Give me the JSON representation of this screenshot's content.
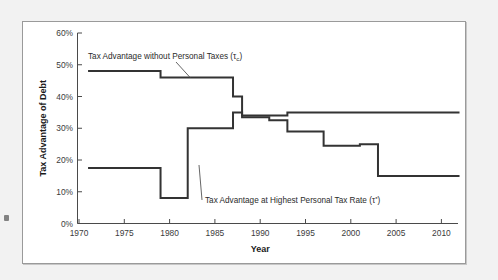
{
  "figure": {
    "panel_background": "#ffffff",
    "page_background": "#f2f2f2",
    "border_color": "#9a9a9a",
    "line_color": "#333333"
  },
  "chart_data": {
    "type": "line",
    "title": "",
    "subtitle": "",
    "xlabel": "Year",
    "ylabel": "Tax Advantage of Debt",
    "xlim": [
      1970,
      2012
    ],
    "ylim": [
      0,
      60
    ],
    "grid": false,
    "legend_position": "inline-annotations",
    "x_ticks": [
      1970,
      1975,
      1980,
      1985,
      1990,
      1995,
      2000,
      2005,
      2010
    ],
    "x_tick_labels": [
      "1970",
      "1975",
      "1980",
      "1985",
      "1990",
      "1995",
      "2000",
      "2005",
      "2010"
    ],
    "y_ticks": [
      0,
      10,
      20,
      30,
      40,
      50,
      60
    ],
    "y_tick_labels": [
      "0%",
      "10%",
      "20%",
      "30%",
      "40%",
      "50%",
      "60%"
    ],
    "step_style": "post",
    "series": [
      {
        "name": "Tax Advantage without Personal Taxes (τc)",
        "label_text": "Tax Advantage without Personal Taxes (",
        "label_symbol": "τ",
        "label_subscript": "c",
        "label_close": ")",
        "x": [
          1971,
          1979,
          1987,
          1988,
          1993,
          2012
        ],
        "values": [
          48,
          46,
          40,
          34,
          35,
          35
        ],
        "points": [
          {
            "year": 1971,
            "value": 48
          },
          {
            "year": 1979,
            "value": 46
          },
          {
            "year": 1987,
            "value": 40
          },
          {
            "year": 1988,
            "value": 34
          },
          {
            "year": 1993,
            "value": 35
          },
          {
            "year": 2012,
            "value": 35
          }
        ]
      },
      {
        "name": "Tax Advantage at Highest Personal Tax Rate (τ*)",
        "label_text": "Tax Advantage at Highest Personal Tax Rate (",
        "label_symbol": "τ",
        "label_subscript": "*",
        "label_close": ")",
        "x": [
          1971,
          1979,
          1982,
          1987,
          1988,
          1991,
          1993,
          1997,
          2001,
          2003,
          2012
        ],
        "values": [
          17.5,
          8,
          30,
          35,
          33.5,
          32.5,
          29,
          24.5,
          25,
          15,
          15
        ],
        "points": [
          {
            "year": 1971,
            "value": 17.5
          },
          {
            "year": 1979,
            "value": 8
          },
          {
            "year": 1982,
            "value": 30
          },
          {
            "year": 1987,
            "value": 35
          },
          {
            "year": 1988,
            "value": 33.5
          },
          {
            "year": 1991,
            "value": 32.5
          },
          {
            "year": 1993,
            "value": 29
          },
          {
            "year": 1997,
            "value": 24.5
          },
          {
            "year": 2001,
            "value": 25
          },
          {
            "year": 2003,
            "value": 15
          },
          {
            "year": 2012,
            "value": 15
          }
        ]
      }
    ],
    "annotations": [
      {
        "id": "annot-upper",
        "text": "Tax Advantage without Personal Taxes (τc)",
        "anchor_year": 1983.2,
        "anchor_value": 46
      },
      {
        "id": "annot-lower",
        "text": "Tax Advantage at Highest Personal Tax Rate (τ*)",
        "anchor_year": 1982,
        "anchor_value": 18
      }
    ]
  },
  "axes": {
    "y_title": "Tax Advantage of Debt",
    "x_title": "Year"
  },
  "labels": {
    "y0": "0%",
    "y10": "10%",
    "y20": "20%",
    "y30": "30%",
    "y40": "40%",
    "y50": "50%",
    "y60": "60%",
    "x1970": "1970",
    "x1975": "1975",
    "x1980": "1980",
    "x1985": "1985",
    "x1990": "1990",
    "x1995": "1995",
    "x2000": "2000",
    "x2005": "2005",
    "x2010": "2010"
  },
  "annotation_upper": {
    "prefix": "Tax Advantage without Personal Taxes (",
    "symbol": "τ",
    "sub": "c",
    "suffix": ")"
  },
  "annotation_lower": {
    "prefix": "Tax Advantage at Highest Personal Tax Rate (",
    "symbol": "τ",
    "sub": "*",
    "suffix": ")"
  }
}
